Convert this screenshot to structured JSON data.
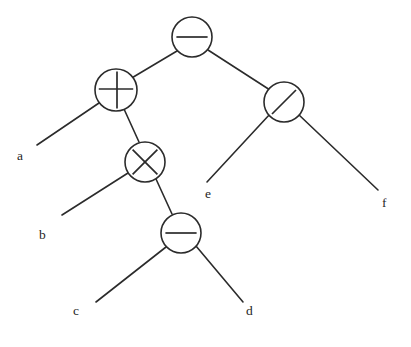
{
  "figure": {
    "background_color": "#ffffff",
    "stroke_color": "#2b2b2b",
    "text_color": "#1f1f1f",
    "caption_fragment": ""
  },
  "chart_data": {
    "type": "diagram",
    "diagram_kind": "binary-expression-tree",
    "expression": "a + b * (c - d) - e / f",
    "nodes": [
      {
        "id": "n1",
        "label": "−",
        "operator_name": "minus",
        "kind": "operator",
        "cx": 192,
        "cy": 37,
        "r": 20,
        "depth": 0
      },
      {
        "id": "n2",
        "label": "+",
        "operator_name": "plus",
        "kind": "operator",
        "cx": 116,
        "cy": 90,
        "r": 21,
        "depth": 1
      },
      {
        "id": "n3",
        "label": "/",
        "operator_name": "divide",
        "kind": "operator",
        "cx": 284,
        "cy": 102,
        "r": 20,
        "depth": 1
      },
      {
        "id": "n4",
        "label": "×",
        "operator_name": "times",
        "kind": "operator",
        "cx": 145,
        "cy": 162,
        "r": 20,
        "depth": 2
      },
      {
        "id": "n5",
        "label": "−",
        "operator_name": "minus",
        "kind": "operator",
        "cx": 181,
        "cy": 233,
        "r": 20,
        "depth": 3
      }
    ],
    "leaves": [
      {
        "id": "la",
        "label": "a",
        "x": 17,
        "y": 149,
        "anchor_x": 37,
        "anchor_y": 145,
        "parent": "n2",
        "side": "left"
      },
      {
        "id": "lb",
        "label": "b",
        "x": 39,
        "y": 228,
        "anchor_x": 62,
        "anchor_y": 215,
        "parent": "n4",
        "side": "left"
      },
      {
        "id": "lc",
        "label": "c",
        "x": 73,
        "y": 304,
        "anchor_x": 96,
        "anchor_y": 302,
        "parent": "n5",
        "side": "left"
      },
      {
        "id": "ld",
        "label": "d",
        "x": 246,
        "y": 304,
        "anchor_x": 243,
        "anchor_y": 302,
        "parent": "n5",
        "side": "right"
      },
      {
        "id": "le",
        "label": "e",
        "x": 205,
        "y": 187,
        "anchor_x": 207,
        "anchor_y": 182,
        "parent": "n3",
        "side": "left"
      },
      {
        "id": "lf",
        "label": "f",
        "x": 382,
        "y": 196,
        "anchor_x": 378,
        "anchor_y": 190,
        "parent": "n3",
        "side": "right"
      }
    ],
    "edges": [
      {
        "from": "n1",
        "to": "n2",
        "x1": 177,
        "y1": 51,
        "x2": 130,
        "y2": 79,
        "label": "root-to-plus"
      },
      {
        "from": "n1",
        "to": "n3",
        "x1": 208,
        "y1": 50,
        "x2": 270,
        "y2": 90,
        "label": "root-to-divide"
      },
      {
        "from": "n2",
        "to": "la",
        "x1": 99,
        "y1": 103,
        "x2": 37,
        "y2": 145,
        "label": "plus-to-a"
      },
      {
        "from": "n2",
        "to": "n4",
        "x1": 124,
        "y1": 109,
        "x2": 139,
        "y2": 142,
        "label": "plus-to-times"
      },
      {
        "from": "n4",
        "to": "lb",
        "x1": 128,
        "y1": 173,
        "x2": 62,
        "y2": 215,
        "label": "times-to-b"
      },
      {
        "from": "n4",
        "to": "n5",
        "x1": 156,
        "y1": 179,
        "x2": 172,
        "y2": 214,
        "label": "times-to-minus"
      },
      {
        "from": "n5",
        "to": "lc",
        "x1": 166,
        "y1": 247,
        "x2": 96,
        "y2": 302,
        "label": "minus-to-c"
      },
      {
        "from": "n5",
        "to": "ld",
        "x1": 196,
        "y1": 246,
        "x2": 243,
        "y2": 302,
        "label": "minus-to-d"
      },
      {
        "from": "n3",
        "to": "le",
        "x1": 270,
        "y1": 114,
        "x2": 207,
        "y2": 182,
        "label": "divide-to-e"
      },
      {
        "from": "n3",
        "to": "lf",
        "x1": 298,
        "y1": 114,
        "x2": 378,
        "y2": 190,
        "label": "divide-to-f"
      }
    ]
  }
}
